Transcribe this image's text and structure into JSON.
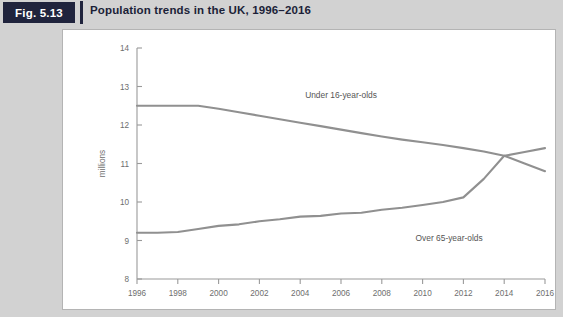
{
  "header": {
    "badge_label": "Fig. 5.13",
    "title": "Population trends in the UK, 1996–2016"
  },
  "chart_data": {
    "type": "line",
    "title": "Population trends in the UK, 1996–2016",
    "xlabel": "",
    "ylabel": "millions",
    "xlim": [
      1996,
      2016
    ],
    "ylim": [
      8,
      14
    ],
    "grid": false,
    "legend_position": "inline-annotation",
    "x_ticks": [
      1996,
      1998,
      2000,
      2002,
      2004,
      2006,
      2008,
      2010,
      2012,
      2014,
      2016
    ],
    "x_tick_labels": [
      "1996",
      "1998",
      "2000",
      "2002",
      "2004",
      "2006",
      "2008",
      "2010",
      "2012",
      "2014",
      "2016"
    ],
    "y_ticks": [
      8,
      9,
      10,
      11,
      12,
      13,
      14
    ],
    "y_tick_labels": [
      "8",
      "9",
      "10",
      "11",
      "12",
      "13",
      "14"
    ],
    "x": [
      1996,
      1997,
      1998,
      1999,
      2000,
      2001,
      2002,
      2003,
      2004,
      2005,
      2006,
      2007,
      2008,
      2009,
      2010,
      2011,
      2012,
      2013,
      2014,
      2015,
      2016
    ],
    "series": [
      {
        "name": "Under 16-year-olds",
        "color": "#909090",
        "label_text": "Under 16-year-olds",
        "values": [
          12.5,
          12.5,
          12.5,
          12.5,
          12.42,
          12.33,
          12.24,
          12.15,
          12.06,
          11.97,
          11.88,
          11.79,
          11.7,
          11.62,
          11.55,
          11.48,
          11.4,
          11.31,
          11.2,
          11.0,
          10.8
        ]
      },
      {
        "name": "Over 65-year-olds",
        "color": "#909090",
        "label_text": "Over 65-year-olds",
        "values": [
          9.2,
          9.2,
          9.22,
          9.3,
          9.38,
          9.42,
          9.5,
          9.55,
          9.62,
          9.64,
          9.7,
          9.72,
          9.8,
          9.85,
          9.92,
          10.0,
          10.12,
          10.6,
          11.2,
          11.3,
          11.4
        ]
      }
    ],
    "annotations": [
      {
        "text": "Under 16-year-olds",
        "x": 2006,
        "y": 12.7
      },
      {
        "text": "Over 65-year-olds",
        "x": 2011.3,
        "y": 9.0
      }
    ]
  }
}
